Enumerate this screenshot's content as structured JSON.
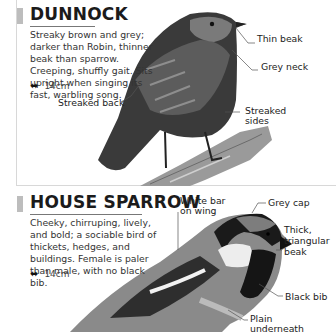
{
  "sections": [
    {
      "title": "DUNNOCK",
      "description": "Streaky brown and grey; darker than Robin, thinner beak than sparrow. Creeping, shuffly gait. Sits upright when singing its fast, warbling song.",
      "size": "14cm",
      "size_icon": "wingspan-arrows-icon",
      "labels": {
        "thin_beak": "Thin beak",
        "grey_neck": "Grey neck",
        "streaked_back": "Streaked back",
        "streaked_sides_1": "Streaked",
        "streaked_sides_2": "sides"
      },
      "illustration": "dunnock-perched-on-branch"
    },
    {
      "title": "HOUSE SPARROW",
      "description": "Cheeky, chirruping, lively, and bold; a sociable bird of thickets, hedges, and buildings. Female is paler than male, with no black bib.",
      "size": "14cm",
      "size_icon": "wingspan-arrows-icon",
      "labels": {
        "white_bar_1": "White bar",
        "white_bar_2": "on wing",
        "grey_cap": "Grey cap",
        "beak_1": "Thick,",
        "beak_2": "triangular",
        "beak_3": "beak",
        "black_bib": "Black bib",
        "plain_1": "Plain",
        "plain_2": "underneath"
      },
      "illustration": "male-house-sparrow"
    }
  ],
  "colors": {
    "tab": "#bdbdbd",
    "frame": "#d8d8d8",
    "text": "#333333"
  }
}
